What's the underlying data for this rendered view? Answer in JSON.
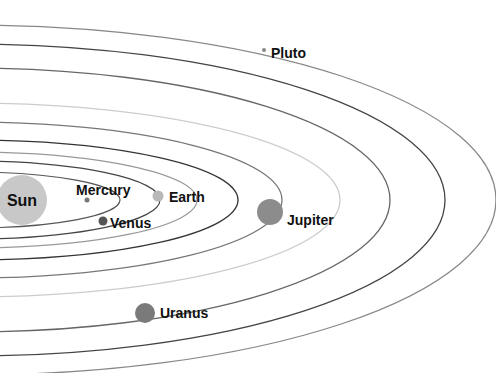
{
  "diagram": {
    "background": "#ffffff",
    "center": {
      "x": -30,
      "y": 200
    },
    "orbits": [
      {
        "name": "mercury-orbit",
        "rx": 150,
        "ry": 28,
        "color": "#555555",
        "width": 1.2
      },
      {
        "name": "venus-orbit",
        "rx": 190,
        "ry": 39,
        "color": "#444444",
        "width": 1.2
      },
      {
        "name": "earth-orbit",
        "rx": 227,
        "ry": 48,
        "color": "#999999",
        "width": 1.2
      },
      {
        "name": "mars-orbit",
        "rx": 268,
        "ry": 60,
        "color": "#333333",
        "width": 1.3
      },
      {
        "name": "jupiter-orbit",
        "rx": 312,
        "ry": 78,
        "color": "#777777",
        "width": 1.3
      },
      {
        "name": "saturn-orbit",
        "rx": 370,
        "ry": 97,
        "color": "#cccccc",
        "width": 1.3
      },
      {
        "name": "uranus-orbit",
        "rx": 420,
        "ry": 132,
        "color": "#666666",
        "width": 1.3
      },
      {
        "name": "neptune-orbit",
        "rx": 475,
        "ry": 156,
        "color": "#444444",
        "width": 1.3
      },
      {
        "name": "pluto-orbit",
        "rx": 526,
        "ry": 175,
        "color": "#888888",
        "width": 1.3
      }
    ],
    "sun": {
      "label": "Sun",
      "x": 22,
      "y": 200,
      "r": 25,
      "color": "#c8c8c8"
    },
    "planets": [
      {
        "name": "Mercury",
        "label": "Mercury",
        "x": 87,
        "y": 200,
        "r": 2.5,
        "color": "#777777",
        "label_x": 76,
        "label_y": 195
      },
      {
        "name": "Venus",
        "label": "Venus",
        "x": 103,
        "y": 221,
        "r": 4.5,
        "color": "#555555",
        "label_x": 110,
        "label_y": 228
      },
      {
        "name": "Earth",
        "label": "Earth",
        "x": 158,
        "y": 196,
        "r": 5.5,
        "color": "#b8b8b8",
        "label_x": 169,
        "label_y": 202
      },
      {
        "name": "Jupiter",
        "label": "Jupiter",
        "x": 270,
        "y": 212,
        "r": 13,
        "color": "#8c8c8c",
        "label_x": 287,
        "label_y": 225
      },
      {
        "name": "Uranus",
        "label": "Uranus",
        "x": 145,
        "y": 313,
        "r": 10,
        "color": "#7a7a7a",
        "label_x": 160,
        "label_y": 318
      },
      {
        "name": "Pluto",
        "label": "Pluto",
        "x": 264,
        "y": 50,
        "r": 2,
        "color": "#888888",
        "label_x": 271,
        "label_y": 58
      }
    ]
  }
}
